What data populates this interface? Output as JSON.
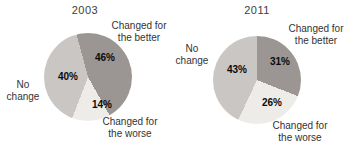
{
  "chart_data": [
    {
      "type": "pie",
      "title": "2003",
      "unit": "%",
      "direction": "clockwise",
      "start_angle_deg": -15,
      "slices": [
        {
          "label": "Changed for the better",
          "value": 46,
          "display": "46%",
          "color": "#9b9693"
        },
        {
          "label": "Changed for the worse",
          "value": 14,
          "display": "14%",
          "color": "#eeece8"
        },
        {
          "label": "No change",
          "value": 40,
          "display": "40%",
          "color": "#c9c6c3"
        }
      ],
      "callouts": {
        "better": "Changed for\nthe better",
        "no_change": "No\nchange",
        "worse": "Changed for\nthe worse"
      }
    },
    {
      "type": "pie",
      "title": "2011",
      "unit": "%",
      "direction": "clockwise",
      "start_angle_deg": 0,
      "slices": [
        {
          "label": "Changed for the better",
          "value": 31,
          "display": "31%",
          "color": "#9b9693"
        },
        {
          "label": "Changed for the worse",
          "value": 26,
          "display": "26%",
          "color": "#eeece8"
        },
        {
          "label": "No change",
          "value": 43,
          "display": "43%",
          "color": "#c9c6c3"
        }
      ],
      "callouts": {
        "better": "Changed for\nthe better",
        "no_change": "No\nchange",
        "worse": "Changed for\nthe worse"
      }
    }
  ]
}
